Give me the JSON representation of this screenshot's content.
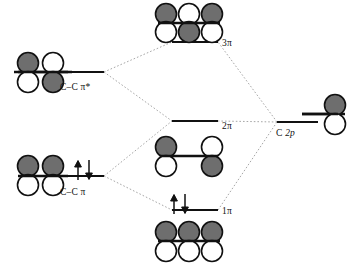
{
  "diagram": {
    "type": "molecular-orbital-interaction-diagram",
    "title": "",
    "fragment_left": "C-C pi system",
    "fragment_right": "C 2p",
    "colors": {
      "lobe_filled": "#6e6e6e",
      "lobe_empty": "#ffffff",
      "stroke": "#1a1a1a",
      "correlation_line": "#9a9a9a",
      "background": "#ffffff"
    },
    "labels": {
      "cc_pi_star": "C–C π*",
      "cc_pi": "C–C π",
      "three_pi": "3π",
      "two_pi": "2π",
      "one_pi": "1π",
      "c2p_C": "C",
      "c2p_2p": "2p"
    },
    "levels": [
      {
        "id": "cc-pi-star",
        "label": "C–C π*",
        "side": "left",
        "energy_rank": 3,
        "electrons": 0,
        "spin_arrows": [],
        "orbital_lobes": 2,
        "phases_top": [
          "filled",
          "empty"
        ],
        "phases_bottom": [
          "empty",
          "filled"
        ]
      },
      {
        "id": "cc-pi",
        "label": "C–C π",
        "side": "left",
        "energy_rank": 1,
        "electrons": 2,
        "spin_arrows": [
          "up",
          "down"
        ],
        "orbital_lobes": 2,
        "phases_top": [
          "filled",
          "filled"
        ],
        "phases_bottom": [
          "empty",
          "empty"
        ]
      },
      {
        "id": "3pi",
        "label": "3π",
        "side": "center",
        "energy_rank": 4,
        "electrons": 0,
        "spin_arrows": [],
        "orbital_lobes": 3,
        "phases_top": [
          "filled",
          "empty",
          "filled"
        ],
        "phases_bottom": [
          "empty",
          "filled",
          "empty"
        ]
      },
      {
        "id": "2pi",
        "label": "2π",
        "side": "center",
        "energy_rank": 2,
        "electrons": 0,
        "spin_arrows": [],
        "orbital_lobes": 2,
        "phases_top": [
          "filled",
          "empty"
        ],
        "phases_bottom": [
          "empty",
          "filled"
        ]
      },
      {
        "id": "1pi",
        "label": "1π",
        "side": "center",
        "energy_rank": 0,
        "electrons": 2,
        "spin_arrows": [
          "up",
          "down"
        ],
        "orbital_lobes": 3,
        "phases_top": [
          "filled",
          "filled",
          "filled"
        ],
        "phases_bottom": [
          "empty",
          "empty",
          "empty"
        ]
      },
      {
        "id": "c-2p",
        "label": "C 2p",
        "side": "right",
        "energy_rank": 2,
        "electrons": 0,
        "spin_arrows": [],
        "orbital_lobes": 1,
        "phases_top": [
          "filled"
        ],
        "phases_bottom": [
          "empty"
        ]
      }
    ],
    "correlations": [
      {
        "from": "cc-pi-star",
        "to": "3pi"
      },
      {
        "from": "cc-pi-star",
        "to": "2pi"
      },
      {
        "from": "cc-pi",
        "to": "2pi"
      },
      {
        "from": "cc-pi",
        "to": "1pi"
      },
      {
        "from": "c-2p",
        "to": "3pi"
      },
      {
        "from": "c-2p",
        "to": "2pi"
      },
      {
        "from": "c-2p",
        "to": "1pi"
      }
    ]
  }
}
